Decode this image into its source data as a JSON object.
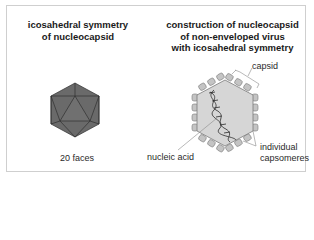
{
  "left_panel": {
    "title_line1": "icosahedral symmetry",
    "title_line2": "of nucleocapsid",
    "caption": "20 faces"
  },
  "right_panel": {
    "title_line1": "construction of nucleocapsid",
    "title_line2": "of non-enveloped virus",
    "title_line3": "with icosahedral symmetry",
    "labels": {
      "capsid": "capsid",
      "nucleic_acid": "nucleic acid",
      "capsomeres_line1": "individual",
      "capsomeres_line2": "capsomeres"
    }
  },
  "colors": {
    "icosahedron_fill": "#6a6a6a",
    "icosahedron_edge": "#2f2f2f",
    "capsid_fill": "#d6d6d6",
    "capsomere_fill": "#c4c4c4",
    "outline": "#7a7a7a",
    "frame_border": "#cfcfcf"
  }
}
